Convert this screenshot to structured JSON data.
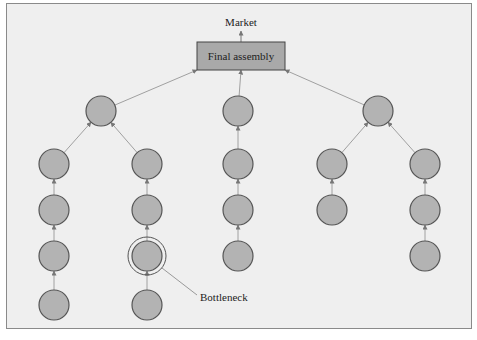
{
  "diagram": {
    "top_label": "Market",
    "root": {
      "label": "Final assembly",
      "fill": "#a9a9a9"
    },
    "bottleneck_label": "Bottleneck",
    "node_fill": "#b3b3b3",
    "node_stroke": "#555555",
    "edge_color": "#a0a0a0",
    "branches": [
      {
        "level1": [
          101,
          111
        ],
        "columns": [
          {
            "x": 54,
            "rows": [
              164,
              210,
              256,
              305
            ]
          },
          {
            "x": 147,
            "rows": [
              164,
              210,
              256,
              305
            ],
            "bottleneck_row": 256
          }
        ]
      },
      {
        "level1": [
          238,
          111
        ],
        "columns": [
          {
            "x": 238,
            "rows": [
              164,
              210,
              256
            ]
          }
        ]
      },
      {
        "level1": [
          378,
          111
        ],
        "columns": [
          {
            "x": 332,
            "rows": [
              164,
              210
            ]
          },
          {
            "x": 425,
            "rows": [
              164,
              210,
              256
            ]
          }
        ]
      }
    ]
  }
}
